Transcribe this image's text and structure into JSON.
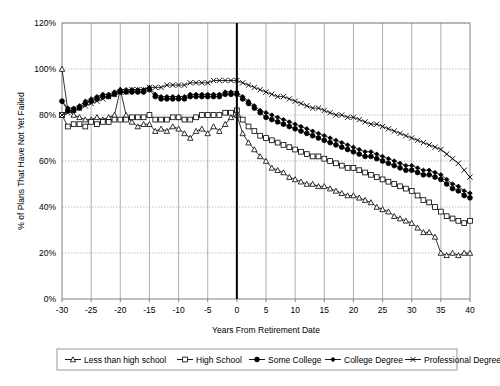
{
  "chart_data": {
    "type": "line",
    "title": "",
    "xlabel": "Years From Retirement Date",
    "ylabel": "% of Plans That Have Not Yet Failed",
    "xlim": [
      -30,
      40
    ],
    "ylim": [
      0,
      120
    ],
    "xticks": [
      -30,
      -25,
      -20,
      -15,
      -10,
      -5,
      0,
      5,
      10,
      15,
      20,
      25,
      30,
      35,
      40
    ],
    "xtick_labels": [
      "-30",
      "-25",
      "-20",
      "-15",
      "-10",
      "-5",
      "0",
      "5",
      "10",
      "15",
      "20",
      "25",
      "30",
      "35",
      "40"
    ],
    "yticks": [
      0,
      20,
      40,
      60,
      80,
      100,
      120
    ],
    "ytick_labels": [
      "0%",
      "20%",
      "40%",
      "60%",
      "80%",
      "100%",
      "120%"
    ],
    "grid": "both-light-dashed-horizontal-solid-vertical",
    "legend_position": "bottom-outside",
    "annotations": [
      {
        "name": "retirement-date-marker",
        "type": "vertical-line",
        "x": 0
      }
    ],
    "x": [
      -30,
      -29,
      -28,
      -27,
      -26,
      -25,
      -24,
      -23,
      -22,
      -21,
      -20,
      -19,
      -18,
      -17,
      -16,
      -15,
      -14,
      -13,
      -12,
      -11,
      -10,
      -9,
      -8,
      -7,
      -6,
      -5,
      -4,
      -3,
      -2,
      -1,
      0,
      1,
      2,
      3,
      4,
      5,
      6,
      7,
      8,
      9,
      10,
      11,
      12,
      13,
      14,
      15,
      16,
      17,
      18,
      19,
      20,
      21,
      22,
      23,
      24,
      25,
      26,
      27,
      28,
      29,
      30,
      31,
      32,
      33,
      34,
      35,
      36,
      37,
      38,
      39,
      40
    ],
    "series": [
      {
        "name": "Less than high school",
        "marker": "triangle-open",
        "values": [
          100,
          82,
          80,
          79,
          78,
          78,
          79,
          78,
          79,
          80,
          91,
          80,
          77,
          75,
          76,
          76,
          73,
          74,
          73,
          75,
          74,
          72,
          70,
          73,
          74,
          72,
          75,
          73,
          76,
          79,
          80,
          72,
          68,
          65,
          62,
          60,
          57,
          56,
          55,
          53,
          52,
          51,
          50,
          50,
          49,
          49,
          48,
          47,
          46,
          45,
          45,
          44,
          43,
          42,
          40,
          39,
          38,
          36,
          35,
          34,
          33,
          31,
          29,
          29,
          27,
          20,
          19,
          20,
          19,
          20,
          20
        ]
      },
      {
        "name": "High School",
        "marker": "square-open",
        "values": [
          80,
          75,
          76,
          76,
          75,
          77,
          76,
          77,
          77,
          78,
          78,
          78,
          79,
          79,
          79,
          80,
          78,
          78,
          78,
          79,
          79,
          78,
          78,
          79,
          80,
          80,
          80,
          80,
          81,
          81,
          82,
          78,
          75,
          73,
          71,
          70,
          69,
          68,
          67,
          66,
          65,
          64,
          63,
          62,
          62,
          61,
          60,
          59,
          58,
          57,
          57,
          56,
          55,
          54,
          53,
          52,
          51,
          50,
          49,
          48,
          47,
          45,
          43,
          42,
          40,
          38,
          36,
          35,
          34,
          33,
          34
        ]
      },
      {
        "name": "Some College",
        "marker": "circle-filled",
        "values": [
          86,
          82,
          82,
          83,
          85,
          86,
          87,
          88,
          88,
          89,
          90,
          90,
          90,
          90,
          90,
          91,
          88,
          87,
          87,
          87,
          87,
          87,
          88,
          88,
          88,
          88,
          88,
          88,
          89,
          89,
          89,
          87,
          85,
          83,
          81,
          79,
          78,
          77,
          76,
          75,
          74,
          73,
          72,
          71,
          70,
          69,
          68,
          67,
          66,
          65,
          64,
          63,
          62,
          62,
          61,
          60,
          59,
          58,
          57,
          56,
          56,
          55,
          54,
          54,
          53,
          52,
          50,
          48,
          47,
          45,
          44
        ]
      },
      {
        "name": "College Degree",
        "marker": "diamond-filled",
        "values": [
          86,
          83,
          83,
          84,
          86,
          87,
          88,
          89,
          89,
          90,
          91,
          91,
          91,
          91,
          91,
          92,
          89,
          88,
          88,
          88,
          88,
          88,
          89,
          89,
          89,
          89,
          89,
          89,
          90,
          90,
          90,
          88,
          86,
          84,
          82,
          81,
          80,
          79,
          78,
          77,
          76,
          75,
          74,
          73,
          72,
          71,
          70,
          69,
          68,
          67,
          66,
          65,
          64,
          64,
          63,
          62,
          61,
          60,
          59,
          58,
          58,
          57,
          56,
          56,
          55,
          54,
          52,
          50,
          49,
          47,
          46
        ]
      },
      {
        "name": "Professional Degree",
        "marker": "cross-x",
        "values": [
          80,
          81,
          82,
          83,
          84,
          85,
          86,
          87,
          88,
          89,
          90,
          90,
          91,
          91,
          91,
          92,
          92,
          92,
          93,
          93,
          93,
          93,
          94,
          94,
          94,
          94,
          95,
          95,
          95,
          95,
          95,
          94,
          93,
          92,
          91,
          90,
          89,
          88,
          88,
          87,
          86,
          85,
          84,
          83,
          83,
          82,
          81,
          80,
          80,
          79,
          79,
          78,
          77,
          76,
          76,
          75,
          74,
          73,
          72,
          71,
          70,
          69,
          68,
          67,
          66,
          65,
          63,
          61,
          59,
          56,
          53
        ]
      }
    ]
  },
  "legend": {
    "items": [
      {
        "label": "Less than high school",
        "marker": "triangle-open"
      },
      {
        "label": "High School",
        "marker": "square-open"
      },
      {
        "label": "Some College",
        "marker": "circle-filled"
      },
      {
        "label": "College Degree",
        "marker": "diamond-filled"
      },
      {
        "label": "Professional Degree",
        "marker": "cross-x"
      }
    ]
  },
  "colors": {
    "line": "#000000",
    "grid_horizontal": "#b0b0b0",
    "grid_vertical": "#9a9a9a",
    "axis": "#808080",
    "marker_fill_open": "#ffffff",
    "background": "#ffffff"
  }
}
